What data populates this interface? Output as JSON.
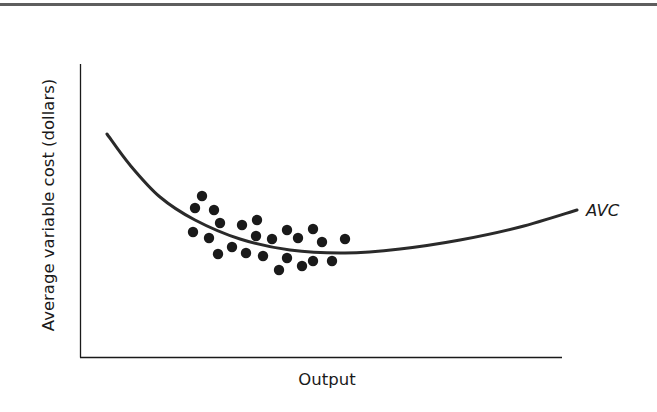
{
  "chart_data": {
    "type": "scatter",
    "title": "",
    "xlabel": "Output",
    "ylabel": "Average variable cost (dollars)",
    "grid": false,
    "legend": null,
    "axis_ticks": false,
    "annotations": [
      {
        "text": "AVC",
        "position": "right end of curve",
        "italic": true
      }
    ],
    "series": [
      {
        "name": "AVC",
        "kind": "line",
        "shape": "U-shaped curve, steep fall then gradual rise",
        "pixel_points": [
          [
            107,
            134
          ],
          [
            130,
            165
          ],
          [
            160,
            197
          ],
          [
            195,
            220
          ],
          [
            240,
            239
          ],
          [
            290,
            250
          ],
          [
            345,
            253
          ],
          [
            400,
            249
          ],
          [
            460,
            240
          ],
          [
            520,
            227
          ],
          [
            577,
            210
          ]
        ]
      },
      {
        "name": "observations",
        "kind": "scatter",
        "count": 26,
        "pixel_points": [
          [
            202,
            196
          ],
          [
            195,
            208
          ],
          [
            214,
            210
          ],
          [
            220,
            223
          ],
          [
            193,
            232
          ],
          [
            209,
            238
          ],
          [
            242,
            225
          ],
          [
            257,
            220
          ],
          [
            256,
            236
          ],
          [
            232,
            247
          ],
          [
            218,
            254
          ],
          [
            246,
            253
          ],
          [
            263,
            256
          ],
          [
            287,
            230
          ],
          [
            272,
            239
          ],
          [
            298,
            238
          ],
          [
            313,
            229
          ],
          [
            322,
            242
          ],
          [
            345,
            239
          ],
          [
            287,
            258
          ],
          [
            279,
            270
          ],
          [
            302,
            266
          ],
          [
            313,
            261
          ],
          [
            332,
            261
          ]
        ]
      }
    ]
  },
  "labels": {
    "x_axis": "Output",
    "y_axis": "Average variable cost (dollars)",
    "curve": "AVC"
  },
  "colors": {
    "ink": "#1a1a1a",
    "rule": "#5e5e5e",
    "background": "#ffffff"
  }
}
